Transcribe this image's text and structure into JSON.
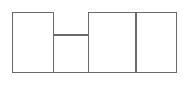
{
  "figure": {
    "title": "",
    "type": "line-drawing",
    "canvas": {
      "width": 188,
      "height": 87
    },
    "style": {
      "background_color": "#ffffff",
      "stroke_color": "#6a6a6a",
      "stroke_width": 1.4,
      "fill_color": "none"
    },
    "geometry": {
      "x_positions": [
        12.7,
        53.5,
        88.7,
        136.0,
        176.7
      ],
      "y_top_tall": 12.3,
      "y_top_short": 35.0,
      "y_bottom": 72.7
    },
    "rectangles": [
      {
        "name": "left-tall-rect",
        "x": 12.7,
        "y": 12.3,
        "width": 40.8,
        "height": 60.4
      },
      {
        "name": "middle-short-rect",
        "x": 53.5,
        "y": 35.0,
        "width": 35.2,
        "height": 37.7
      },
      {
        "name": "right-inner-rect",
        "x": 88.7,
        "y": 12.3,
        "width": 47.3,
        "height": 60.4
      },
      {
        "name": "right-outer-rect",
        "x": 136.0,
        "y": 12.3,
        "width": 40.7,
        "height": 60.4
      }
    ]
  }
}
